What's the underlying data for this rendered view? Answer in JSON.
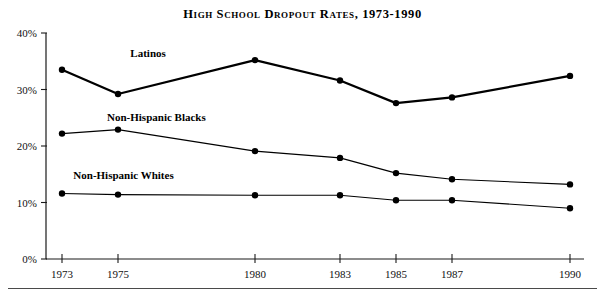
{
  "chart_data": {
    "type": "line",
    "title": "High School Dropout Rates, 1973-1990",
    "xlabel": "",
    "ylabel": "",
    "x": [
      1973,
      1975,
      1980,
      1983,
      1985,
      1987,
      1990
    ],
    "xtick_labels": [
      "1973",
      "1975",
      "1980",
      "1983",
      "1985",
      "1987",
      "1990"
    ],
    "ytick_labels": [
      "0%",
      "10%",
      "20%",
      "30%",
      "40%"
    ],
    "ytick_values": [
      0,
      10,
      20,
      30,
      40
    ],
    "ylim": [
      0,
      40
    ],
    "xlim": [
      1973,
      1990
    ],
    "grid": false,
    "legend_position": "inline-labels",
    "series": [
      {
        "name": "Latinos",
        "values": [
          33.5,
          29.2,
          35.2,
          31.6,
          27.6,
          28.6,
          32.4
        ],
        "color": "#000000",
        "line_weight": "thick",
        "label_x": 1976.1,
        "label_y": 35.8
      },
      {
        "name": "Non-Hispanic Blacks",
        "values": [
          22.2,
          22.9,
          19.1,
          17.9,
          15.2,
          14.1,
          13.2
        ],
        "color": "#000000",
        "line_weight": "thin",
        "label_x": 1976.4,
        "label_y": 24.4
      },
      {
        "name": "Non-Hispanic Whites",
        "values": [
          11.6,
          11.4,
          11.3,
          11.3,
          10.4,
          10.4,
          9.0
        ],
        "color": "#000000",
        "line_weight": "thin",
        "label_x": 1975.2,
        "label_y": 14.2
      }
    ]
  }
}
